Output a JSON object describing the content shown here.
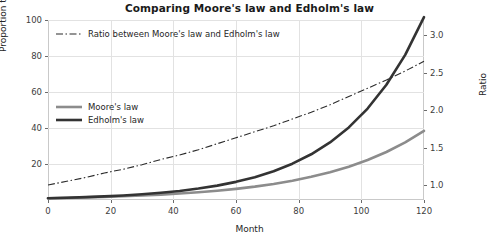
{
  "chart_data": {
    "type": "line",
    "title": "Comparing Moore's law and Edholm's law",
    "xlabel": "Month",
    "ylabel": "Proportion to month 0",
    "y2label": "Ratio",
    "xlim": [
      0,
      120
    ],
    "ylim": [
      0,
      100
    ],
    "y2lim": [
      0.8,
      3.2
    ],
    "xticks": [
      0,
      20,
      40,
      60,
      80,
      100,
      120
    ],
    "yticks": [
      20,
      40,
      60,
      80,
      100
    ],
    "y2ticks": [
      1.0,
      1.5,
      2.0,
      2.5,
      3.0
    ],
    "xtick_labels": [
      "0",
      "20",
      "40",
      "60",
      "80",
      "100",
      "120"
    ],
    "ytick_labels": [
      "20",
      "40",
      "60",
      "80",
      "100"
    ],
    "y2tick_labels": [
      "1.0",
      "1.5",
      "2.0",
      "2.5",
      "3.0"
    ],
    "grid": true,
    "legend_position": "upper left",
    "x": [
      0,
      6,
      12,
      18,
      24,
      30,
      36,
      42,
      48,
      54,
      60,
      66,
      72,
      78,
      84,
      90,
      96,
      102,
      108,
      114,
      120
    ],
    "series": [
      {
        "name": "Moore's law",
        "axis": "left",
        "style": "solid",
        "color": "#8c8c8c",
        "values": [
          1.0,
          1.2,
          1.44,
          1.73,
          2.08,
          2.49,
          2.99,
          3.59,
          4.31,
          5.17,
          6.2,
          7.44,
          8.93,
          10.72,
          12.86,
          15.43,
          18.51,
          22.22,
          26.66,
          31.99,
          38.38
        ]
      },
      {
        "name": "Edholm's law",
        "axis": "left",
        "style": "solid",
        "color": "#333333",
        "values": [
          1.0,
          1.26,
          1.59,
          2.0,
          2.52,
          3.17,
          4.0,
          5.04,
          6.35,
          8.0,
          10.08,
          12.7,
          16.0,
          20.16,
          25.4,
          32.0,
          40.32,
          50.8,
          64.0,
          80.63,
          101.59
        ]
      },
      {
        "name": "Ratio between Moore's law and Edholm's law",
        "axis": "right",
        "style": "dashdot",
        "color": "#2b2b2b",
        "values": [
          1.0,
          1.05,
          1.1,
          1.16,
          1.21,
          1.27,
          1.34,
          1.4,
          1.47,
          1.55,
          1.63,
          1.71,
          1.79,
          1.88,
          1.97,
          2.07,
          2.18,
          2.29,
          2.4,
          2.52,
          2.65
        ]
      }
    ]
  },
  "legend_ratio": {
    "label": "Ratio between Moore's law and Edholm's law"
  },
  "legend_laws": {
    "moore_label": "Moore's law",
    "edholm_label": "Edholm's law"
  },
  "colors": {
    "moore": "#8c8c8c",
    "edholm": "#333333",
    "ratio": "#2b2b2b",
    "grid": "#e2e2e2",
    "frame": "#c9c9c9",
    "background": "#ffffff"
  }
}
